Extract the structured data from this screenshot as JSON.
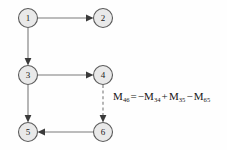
{
  "diagram": {
    "type": "directed-graph",
    "background_color": "#fefefe",
    "node_fill_color": "#e9e9e9",
    "node_stroke_color": "#5b5b5b",
    "edge_color": "#7a7a7a",
    "arrow_color": "#3a3a3a",
    "nodes": [
      {
        "id": "1",
        "label": "1",
        "cx": 28,
        "cy": 18,
        "r": 9.5
      },
      {
        "id": "2",
        "label": "2",
        "cx": 103,
        "cy": 18,
        "r": 9.5
      },
      {
        "id": "3",
        "label": "3",
        "cx": 28,
        "cy": 75,
        "r": 9.5
      },
      {
        "id": "4",
        "label": "4",
        "cx": 103,
        "cy": 75,
        "r": 9.5
      },
      {
        "id": "5",
        "label": "5",
        "cx": 28,
        "cy": 132,
        "r": 9.5
      },
      {
        "id": "6",
        "label": "6",
        "cx": 103,
        "cy": 132,
        "r": 9.5
      }
    ],
    "edges": [
      {
        "from": "1",
        "to": "2",
        "style": "solid",
        "direction": "right"
      },
      {
        "from": "1",
        "to": "3",
        "style": "solid",
        "direction": "down"
      },
      {
        "from": "3",
        "to": "4",
        "style": "solid",
        "direction": "right"
      },
      {
        "from": "3",
        "to": "5",
        "style": "solid",
        "direction": "down"
      },
      {
        "from": "4",
        "to": "6",
        "style": "dashed",
        "direction": "down"
      },
      {
        "from": "6",
        "to": "5",
        "style": "solid",
        "direction": "left"
      }
    ]
  },
  "equation": {
    "lhs_symbol": "M",
    "lhs_subscript": "46",
    "equals": "=",
    "term1_sign": "−",
    "term1_symbol": "M",
    "term1_subscript": "34",
    "term2_sign": "+",
    "term2_symbol": "M",
    "term2_subscript": "35",
    "term3_sign": "−",
    "term3_symbol": "M",
    "term3_subscript": "65",
    "full_text": "M46 = −M34 + M35 − M65"
  }
}
